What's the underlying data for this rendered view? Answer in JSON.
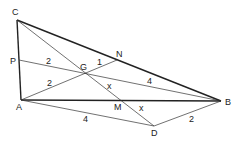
{
  "diagram": {
    "type": "geometry",
    "points": {
      "C": {
        "label": "C",
        "x": 17,
        "y": 20
      },
      "A": {
        "label": "A",
        "x": 21,
        "y": 100
      },
      "P": {
        "label": "P",
        "x": 19,
        "y": 60
      },
      "G": {
        "label": "G",
        "x": 83,
        "y": 72
      },
      "N": {
        "label": "N",
        "x": 117,
        "y": 60
      },
      "M": {
        "label": "M",
        "x": 118,
        "y": 100
      },
      "B": {
        "label": "B",
        "x": 221,
        "y": 101
      },
      "D": {
        "label": "D",
        "x": 154,
        "y": 126
      }
    },
    "segment_labels": {
      "PG": "2",
      "AG": "2",
      "GN": "1",
      "GB": "4",
      "GM": "x",
      "MD": "x",
      "AD": "4",
      "DB": "2"
    }
  }
}
